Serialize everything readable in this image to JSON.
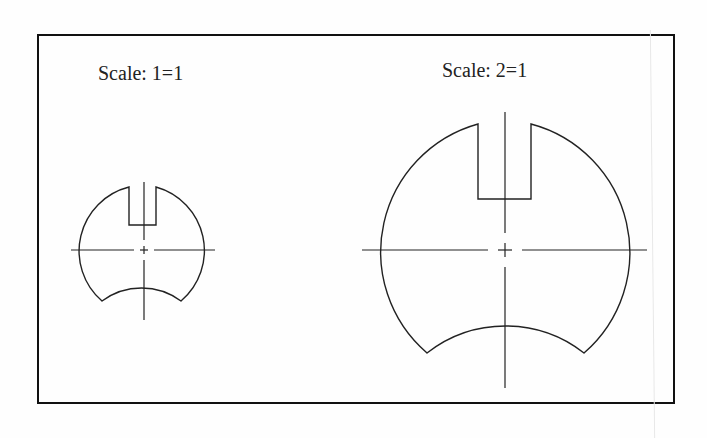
{
  "drawing": {
    "views": [
      {
        "label": "Scale: 1=1",
        "scale": "1=1",
        "center": [
          144,
          250
        ],
        "radius": 66,
        "slot": {
          "x1": 129,
          "x2": 156,
          "top": 187,
          "bottom": 225
        },
        "bottom_arc": {
          "left": [
            102,
            301
          ],
          "apex": [
            144,
            288
          ],
          "right": [
            181,
            301
          ]
        },
        "centerline_v": [
          182,
          320
        ],
        "centerline_h": [
          71,
          215
        ]
      },
      {
        "label": "Scale: 2=1",
        "scale": "2=1",
        "center": [
          505,
          250
        ],
        "radius": 133,
        "slot": {
          "x1": 478,
          "x2": 531,
          "top": 124,
          "bottom": 199
        },
        "bottom_arc": {
          "left": [
            427,
            353
          ],
          "apex": [
            505,
            326
          ],
          "right": [
            584,
            353
          ]
        },
        "centerline_v": [
          112,
          388
        ],
        "centerline_h": [
          362,
          647
        ]
      }
    ],
    "line_color": "#222222",
    "frame_color": "#111111"
  }
}
